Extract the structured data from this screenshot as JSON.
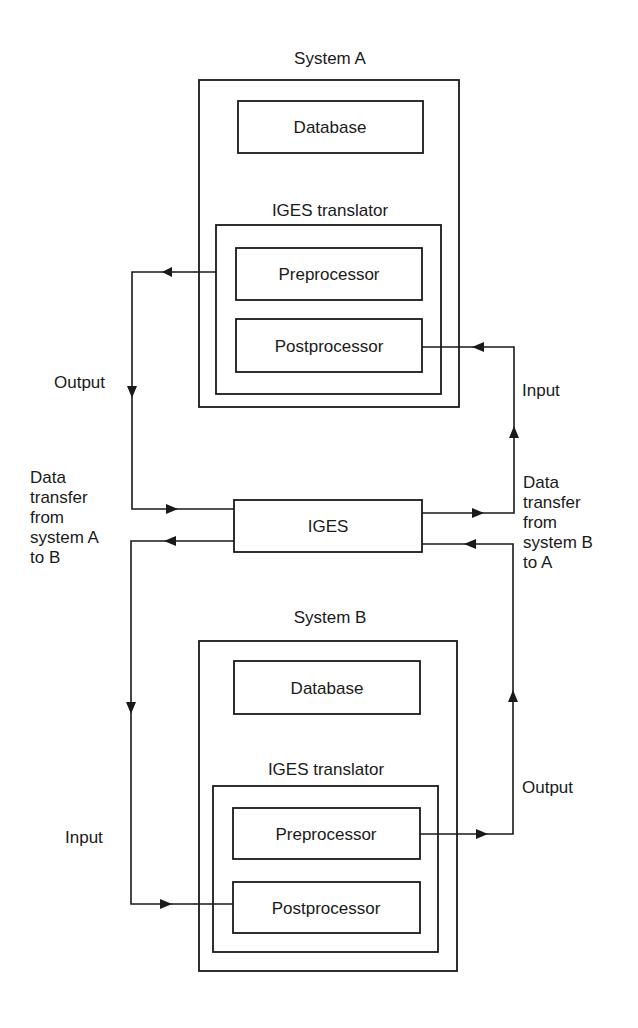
{
  "system_a": {
    "title": "System A",
    "database": "Database",
    "translator_title": "IGES translator",
    "preprocessor": "Preprocessor",
    "postprocessor": "Postprocessor"
  },
  "system_b": {
    "title": "System B",
    "database": "Database",
    "translator_title": "IGES translator",
    "preprocessor": "Preprocessor",
    "postprocessor": "Postprocessor"
  },
  "iges": {
    "label": "IGES"
  },
  "labels": {
    "output_a": "Output",
    "input_a": "Input",
    "input_b": "Input",
    "output_b": "Output",
    "transfer_a_to_b": [
      "Data",
      "transfer",
      "from",
      "system A",
      "to B"
    ],
    "transfer_b_to_a": [
      "Data",
      "transfer",
      "from",
      "system B",
      "to A"
    ]
  }
}
